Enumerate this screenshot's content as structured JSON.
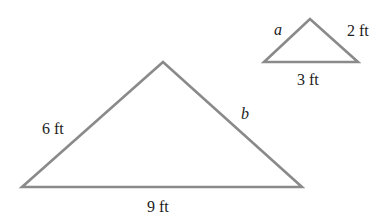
{
  "figure": {
    "large_triangle": {
      "points": "22,187 163,62 302,187",
      "labels": {
        "left_side": "6 ft",
        "right_side": "b",
        "base": "9 ft"
      }
    },
    "small_triangle": {
      "points": "264,62 310,19 358,62",
      "labels": {
        "left_side": "a",
        "right_side": "2 ft",
        "base": "3 ft"
      }
    },
    "line_color": "#8a8a8a",
    "text_color": "#222222"
  }
}
